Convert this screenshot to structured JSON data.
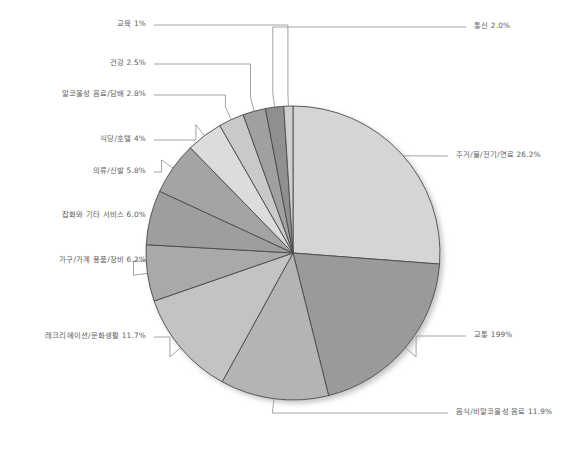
{
  "chart_data": {
    "type": "pie",
    "title": "",
    "subtitle": "",
    "xlabel": "",
    "ylabel": "",
    "legend_position": "none",
    "grid": false,
    "start_angle_deg": 0,
    "direction": "clockwise",
    "units": "percent",
    "categories": [
      "주거/물/전기/연료",
      "교통",
      "음식/비알코올성 음료",
      "레크리에이션/문화생활",
      "가구/가계 용품/장비",
      "잡화와 기타 서비스",
      "의류/신발",
      "식당/호텔",
      "알코올성 음료/담배",
      "건강",
      "통신",
      "교육"
    ],
    "values": [
      26.2,
      19.9,
      11.9,
      11.7,
      6.2,
      6.0,
      5.8,
      4.0,
      2.8,
      2.5,
      2.0,
      1.0
    ],
    "value_labels": [
      "26.2%",
      "199%",
      "11.9%",
      "11.7%",
      "6.2%",
      "6.0%",
      "5.8%",
      "4%",
      "2.8%",
      "2.5%",
      "2.0%",
      "1%"
    ],
    "slice_colors": [
      "#d5d5d5",
      "#9a9a9a",
      "#b4b4b4",
      "#c3c3c3",
      "#a9a9a9",
      "#9e9e9e",
      "#a4a4a4",
      "#dcdcdc",
      "#c9c9c9",
      "#a0a0a0",
      "#8f8f8f",
      "#cfcfcf"
    ],
    "slice_outline_color": "#4a4a4a",
    "leader_line_color": "#8d8d8d",
    "label_text_color": "#5d5d5d",
    "background_color": "#ffffff"
  },
  "labels": [
    {
      "name": "housing",
      "text": "주거/물/전기/연료 26.2%",
      "side": "right",
      "x": 438,
      "y": 156
    },
    {
      "name": "transport",
      "text": "교통 199%",
      "side": "right",
      "x": 456,
      "y": 336
    },
    {
      "name": "food",
      "text": "음식/비알코올성 음료 11.9%",
      "side": "right",
      "x": 438,
      "y": 413
    },
    {
      "name": "recreation",
      "text": "레크리에이션/문화생활 11.7%",
      "side": "left",
      "x": 148,
      "y": 337
    },
    {
      "name": "furniture",
      "text": "가구/가계 용품/장비 6.2%",
      "side": "left",
      "x": 148,
      "y": 261
    },
    {
      "name": "misc-services",
      "text": "잡화와 기타 서비스 6.0%",
      "side": "left",
      "x": 148,
      "y": 216
    },
    {
      "name": "clothing",
      "text": "의류/신발 5.8%",
      "side": "left",
      "x": 148,
      "y": 172
    },
    {
      "name": "restaurant-hotel",
      "text": "식당/호텔 4%",
      "side": "left",
      "x": 148,
      "y": 140
    },
    {
      "name": "alcohol-tobacco",
      "text": "알코올성 음료/담배 2.8%",
      "side": "left",
      "x": 148,
      "y": 95
    },
    {
      "name": "health",
      "text": "건강 2.5%",
      "side": "left",
      "x": 148,
      "y": 64
    },
    {
      "name": "communication",
      "text": "통신 2.0%",
      "side": "right",
      "x": 456,
      "y": 27
    },
    {
      "name": "education",
      "text": "교육 1%",
      "side": "left",
      "x": 148,
      "y": 25
    }
  ],
  "geometry": {
    "cx": 293,
    "cy": 253,
    "r": 147
  }
}
